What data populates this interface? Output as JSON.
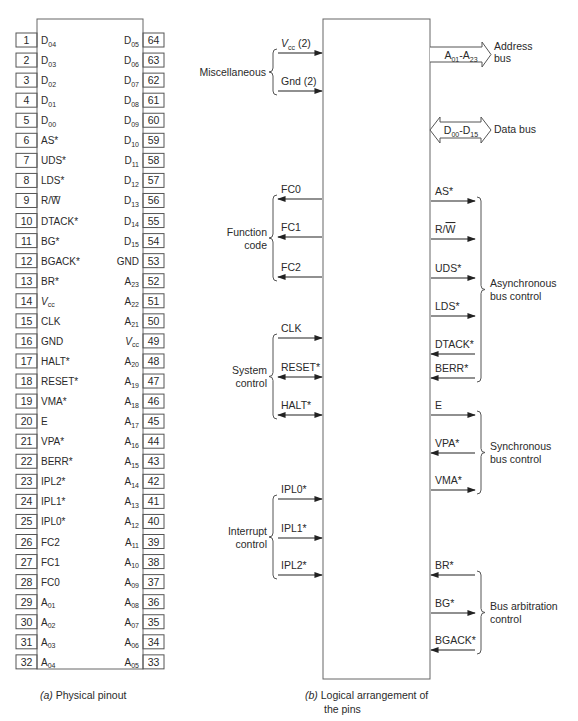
{
  "left_panel": {
    "caption_prefix": "(a)",
    "caption_text": " Physical pinout",
    "pins_left": [
      {
        "num": "1",
        "label": "D",
        "sub": "04"
      },
      {
        "num": "2",
        "label": "D",
        "sub": "03"
      },
      {
        "num": "3",
        "label": "D",
        "sub": "02"
      },
      {
        "num": "4",
        "label": "D",
        "sub": "01"
      },
      {
        "num": "5",
        "label": "D",
        "sub": "00"
      },
      {
        "num": "6",
        "label": "AS*",
        "sub": ""
      },
      {
        "num": "7",
        "label": "UDS*",
        "sub": ""
      },
      {
        "num": "8",
        "label": "LDS*",
        "sub": ""
      },
      {
        "num": "9",
        "label": "R/W̅",
        "sub": ""
      },
      {
        "num": "10",
        "label": "DTACK*",
        "sub": ""
      },
      {
        "num": "11",
        "label": "BG*",
        "sub": ""
      },
      {
        "num": "12",
        "label": "BGACK*",
        "sub": ""
      },
      {
        "num": "13",
        "label": "BR*",
        "sub": ""
      },
      {
        "num": "14",
        "label": "V",
        "sub": "cc",
        "italic": true
      },
      {
        "num": "15",
        "label": "CLK",
        "sub": ""
      },
      {
        "num": "16",
        "label": "GND",
        "sub": ""
      },
      {
        "num": "17",
        "label": "HALT*",
        "sub": ""
      },
      {
        "num": "18",
        "label": "RESET*",
        "sub": ""
      },
      {
        "num": "19",
        "label": "VMA*",
        "sub": ""
      },
      {
        "num": "20",
        "label": "E",
        "sub": ""
      },
      {
        "num": "21",
        "label": "VPA*",
        "sub": ""
      },
      {
        "num": "22",
        "label": "BERR*",
        "sub": ""
      },
      {
        "num": "23",
        "label": "IPL2*",
        "sub": ""
      },
      {
        "num": "24",
        "label": "IPL1*",
        "sub": ""
      },
      {
        "num": "25",
        "label": "IPL0*",
        "sub": ""
      },
      {
        "num": "26",
        "label": "FC2",
        "sub": ""
      },
      {
        "num": "27",
        "label": "FC1",
        "sub": ""
      },
      {
        "num": "28",
        "label": "FC0",
        "sub": ""
      },
      {
        "num": "29",
        "label": "A",
        "sub": "01"
      },
      {
        "num": "30",
        "label": "A",
        "sub": "02"
      },
      {
        "num": "31",
        "label": "A",
        "sub": "03"
      },
      {
        "num": "32",
        "label": "A",
        "sub": "04"
      }
    ],
    "pins_right": [
      {
        "num": "64",
        "label": "D",
        "sub": "05"
      },
      {
        "num": "63",
        "label": "D",
        "sub": "06"
      },
      {
        "num": "62",
        "label": "D",
        "sub": "07"
      },
      {
        "num": "61",
        "label": "D",
        "sub": "08"
      },
      {
        "num": "60",
        "label": "D",
        "sub": "09"
      },
      {
        "num": "59",
        "label": "D",
        "sub": "10"
      },
      {
        "num": "58",
        "label": "D",
        "sub": "11"
      },
      {
        "num": "57",
        "label": "D",
        "sub": "12"
      },
      {
        "num": "56",
        "label": "D",
        "sub": "13"
      },
      {
        "num": "55",
        "label": "D",
        "sub": "14"
      },
      {
        "num": "54",
        "label": "D",
        "sub": "15"
      },
      {
        "num": "53",
        "label": "GND",
        "sub": ""
      },
      {
        "num": "52",
        "label": "A",
        "sub": "23"
      },
      {
        "num": "51",
        "label": "A",
        "sub": "22"
      },
      {
        "num": "50",
        "label": "A",
        "sub": "21"
      },
      {
        "num": "49",
        "label": "V",
        "sub": "cc",
        "italic": true
      },
      {
        "num": "48",
        "label": "A",
        "sub": "20"
      },
      {
        "num": "47",
        "label": "A",
        "sub": "19"
      },
      {
        "num": "46",
        "label": "A",
        "sub": "18"
      },
      {
        "num": "45",
        "label": "A",
        "sub": "17"
      },
      {
        "num": "44",
        "label": "A",
        "sub": "16"
      },
      {
        "num": "43",
        "label": "A",
        "sub": "15"
      },
      {
        "num": "42",
        "label": "A",
        "sub": "14"
      },
      {
        "num": "41",
        "label": "A",
        "sub": "13"
      },
      {
        "num": "40",
        "label": "A",
        "sub": "12"
      },
      {
        "num": "39",
        "label": "A",
        "sub": "11"
      },
      {
        "num": "38",
        "label": "A",
        "sub": "10"
      },
      {
        "num": "37",
        "label": "A",
        "sub": "09"
      },
      {
        "num": "36",
        "label": "A",
        "sub": "08"
      },
      {
        "num": "35",
        "label": "A",
        "sub": "07"
      },
      {
        "num": "34",
        "label": "A",
        "sub": "06"
      },
      {
        "num": "33",
        "label": "A",
        "sub": "05"
      }
    ]
  },
  "right_panel": {
    "caption_prefix": "(b)",
    "caption_line1": " Logical arrangement of",
    "caption_line2": "the pins",
    "left_groups": [
      {
        "name": "Miscellaneous",
        "lines": [
          "Miscellaneous"
        ],
        "signals": [
          {
            "label": "V",
            "sub": "cc",
            "suffix": " (2)",
            "italic": true,
            "dir": "in",
            "y": 53
          },
          {
            "label": "Gnd (2)",
            "sub": "",
            "suffix": "",
            "dir": "in",
            "y": 91
          }
        ]
      },
      {
        "name": "Function code",
        "lines": [
          "Function",
          "code"
        ],
        "signals": [
          {
            "label": "FC0",
            "dir": "out",
            "y": 199
          },
          {
            "label": "FC1",
            "dir": "out",
            "y": 237
          },
          {
            "label": "FC2",
            "dir": "out",
            "y": 277
          }
        ]
      },
      {
        "name": "System control",
        "lines": [
          "System",
          "control"
        ],
        "signals": [
          {
            "label": "CLK",
            "dir": "in",
            "y": 338
          },
          {
            "label": "RESET*",
            "dir": "bi",
            "y": 377
          },
          {
            "label": "HALT*",
            "dir": "bi",
            "y": 415
          }
        ]
      },
      {
        "name": "Interrupt control",
        "lines": [
          "Interrupt",
          "control"
        ],
        "signals": [
          {
            "label": "IPL0*",
            "dir": "in",
            "y": 499
          },
          {
            "label": "IPL1*",
            "dir": "in",
            "y": 538
          },
          {
            "label": "IPL2*",
            "dir": "in",
            "y": 575
          }
        ]
      }
    ],
    "right_groups": [
      {
        "name": "Asynchronous bus control",
        "lines": [
          "Asynchronous",
          "bus control"
        ],
        "signals": [
          {
            "label": "AS*",
            "dir": "out",
            "y": 201
          },
          {
            "label": "R/W",
            "overline": "W",
            "dir": "out",
            "y": 239
          },
          {
            "label": "UDS*",
            "dir": "out",
            "y": 278
          },
          {
            "label": "LDS*",
            "dir": "out",
            "y": 316
          },
          {
            "label": "DTACK*",
            "dir": "in",
            "y": 354
          },
          {
            "label": "BERR*",
            "dir": "in",
            "y": 378
          }
        ]
      },
      {
        "name": "Synchronous bus control",
        "lines": [
          "Synchronous",
          "bus control"
        ],
        "signals": [
          {
            "label": "E",
            "dir": "out",
            "y": 415
          },
          {
            "label": "VPA*",
            "dir": "in",
            "y": 453
          },
          {
            "label": "VMA*",
            "dir": "out",
            "y": 490
          }
        ]
      },
      {
        "name": "Bus arbitration control",
        "lines": [
          "Bus arbitration",
          "control"
        ],
        "signals": [
          {
            "label": "BR*",
            "dir": "in",
            "y": 575
          },
          {
            "label": "BG*",
            "dir": "out",
            "y": 613
          },
          {
            "label": "BGACK*",
            "dir": "in",
            "y": 650
          }
        ]
      }
    ],
    "buses": [
      {
        "name": "Address bus",
        "label_a": "A",
        "sub_a": "01",
        "label_b": "A",
        "sub_b": "23",
        "lines": [
          "Address",
          "bus"
        ],
        "type": "out"
      },
      {
        "name": "Data bus",
        "label_a": "D",
        "sub_a": "00",
        "label_b": "D",
        "sub_b": "15",
        "lines": [
          "Data bus"
        ],
        "type": "bi"
      }
    ]
  },
  "colors": {
    "ink": "#2a2a2a",
    "line": "#555555",
    "bg": "#ffffff"
  }
}
